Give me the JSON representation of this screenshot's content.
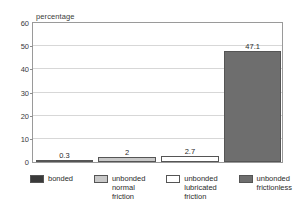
{
  "chart_data": {
    "type": "bar",
    "title": "",
    "xlabel": "",
    "ylabel": "percentage",
    "ylim": [
      0,
      60
    ],
    "yticks": [
      0,
      10,
      20,
      30,
      40,
      50,
      60
    ],
    "grid": true,
    "legend_position": "bottom",
    "categories": [
      "bonded",
      "unbonded normal friction",
      "unbonded lubricated friction",
      "unbonded frictionless"
    ],
    "values": [
      0.3,
      2,
      2.7,
      47.1
    ],
    "value_labels": [
      "0.3",
      "2",
      "2.7",
      "47.1"
    ],
    "colors": [
      "#3a3a3a",
      "#c8c8c8",
      "#ffffff",
      "#6e6e6e"
    ]
  },
  "legend": {
    "items": [
      {
        "label": "bonded",
        "color": "#3a3a3a"
      },
      {
        "label": "unbonded\nnormal\nfriction",
        "color": "#c8c8c8"
      },
      {
        "label": "unbonded\nlubricated\nfriction",
        "color": "#ffffff"
      },
      {
        "label": "unbonded\nfrictionless",
        "color": "#6e6e6e"
      }
    ]
  },
  "axis": {
    "y_title": "percentage",
    "y_tick_labels": [
      "60",
      "50",
      "40",
      "30",
      "20",
      "10",
      "0"
    ]
  }
}
